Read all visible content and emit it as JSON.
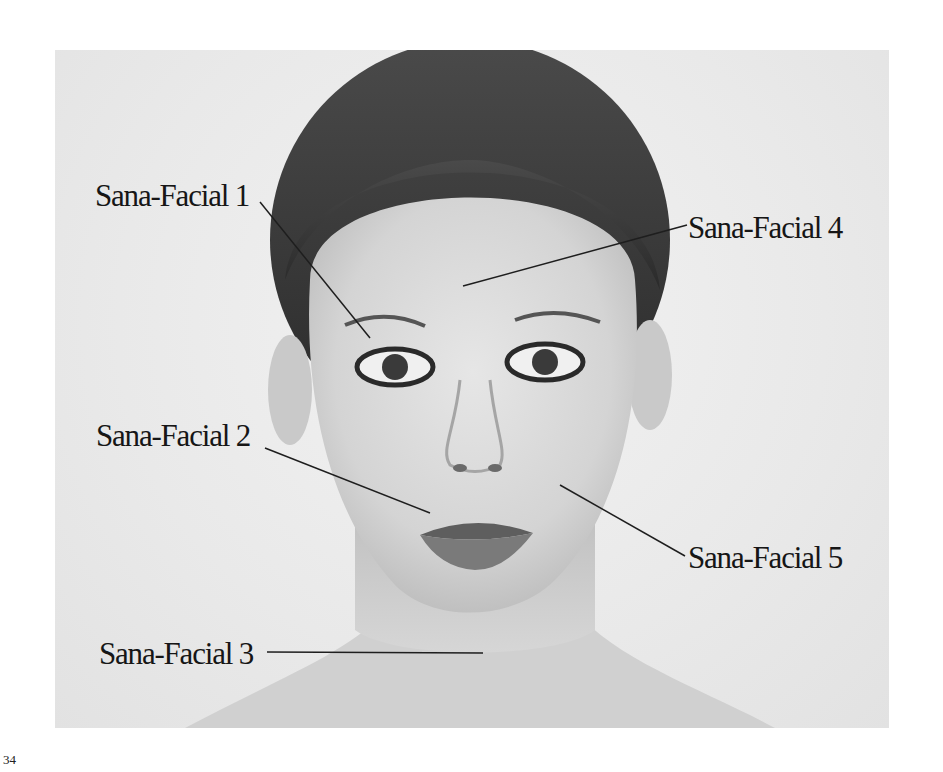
{
  "page": {
    "number": "34"
  },
  "photo": {
    "subject": "portrait-face",
    "background_color": "#e9e9e9"
  },
  "labels": [
    {
      "id": "sana-facial-1",
      "text": "Sana-Facial 1"
    },
    {
      "id": "sana-facial-2",
      "text": "Sana-Facial 2"
    },
    {
      "id": "sana-facial-3",
      "text": "Sana-Facial 3"
    },
    {
      "id": "sana-facial-4",
      "text": "Sana-Facial 4"
    },
    {
      "id": "sana-facial-5",
      "text": "Sana-Facial 5"
    }
  ]
}
